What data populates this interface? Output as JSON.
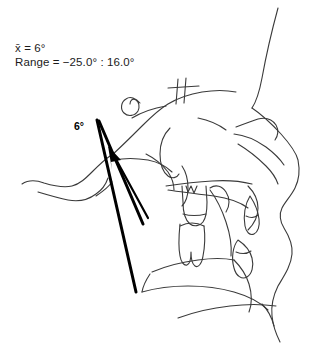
{
  "figure": {
    "background_color": "#ffffff",
    "tracing_color": "#3a3a3a",
    "measurement_color": "#000000",
    "text_color": "#1b1b1b"
  },
  "statistics": {
    "mean_line": "x̄ = 6°",
    "range_line": "Range = −25.0° : 16.0°"
  },
  "measurement": {
    "angle_label": "6°",
    "mean_value": 6,
    "range_min": -25.0,
    "range_max": 16.0,
    "unit": "degrees"
  },
  "anatomy": {
    "structures": [
      "cranial-base-outline",
      "sella-turcica",
      "sphenoid-cross-marks",
      "orbit",
      "nasal-profile",
      "upper-lip",
      "lower-lip",
      "maxilla",
      "mandible",
      "chin-symphysis",
      "upper-molar",
      "lower-molar",
      "upper-incisor",
      "lower-incisor",
      "occipital-outline",
      "cervical-vertebrae"
    ]
  }
}
